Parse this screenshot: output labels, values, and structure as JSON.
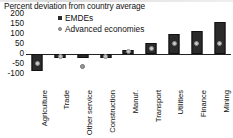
{
  "chart_data": {
    "type": "bar",
    "title": "Percent deviation from country average",
    "xlabel": "",
    "ylabel": "",
    "ylim": [
      -100,
      200
    ],
    "yticks": [
      200,
      150,
      100,
      50,
      0,
      -50,
      -100
    ],
    "ytick_labels": [
      "200",
      "150",
      "100",
      "50",
      "0",
      "-50",
      "-100"
    ],
    "grid": false,
    "legend_position": "top-left-inside",
    "categories": [
      "Agriculture",
      "Trade",
      "Other service",
      "Construction",
      "Manuf.",
      "Transport",
      "Utilities",
      "Finance",
      "Mining"
    ],
    "series": [
      {
        "name": "EMDEs",
        "marker": "square",
        "color": "#2b2b2b",
        "type": "bar",
        "values": [
          -85,
          -20,
          -20,
          -22,
          20,
          55,
          100,
          115,
          160
        ]
      },
      {
        "name": "Advanced economies",
        "marker": "diamond",
        "color": "#a5a5a5",
        "type": "scatter",
        "values": [
          -45,
          -12,
          -60,
          -12,
          12,
          28,
          52,
          52,
          52
        ]
      }
    ]
  },
  "legend": {
    "items": [
      {
        "label": "EMDEs",
        "glyph": "square-marker"
      },
      {
        "label": "Advanced economies",
        "glyph": "diamond-marker"
      }
    ]
  }
}
